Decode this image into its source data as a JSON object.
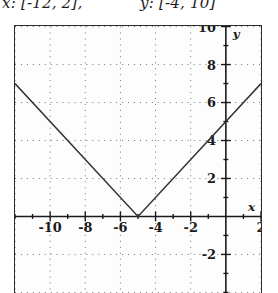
{
  "caption": {
    "x_part": "x: [-12, 2],",
    "y_part": "y: [-4, 10]"
  },
  "axis_labels": {
    "x": "x",
    "y": "y"
  },
  "chart_data": {
    "type": "line",
    "title": "",
    "xlabel": "x",
    "ylabel": "y",
    "xlim": [
      -12,
      2
    ],
    "ylim": [
      -4,
      10
    ],
    "grid": true,
    "grid_style": "dotted",
    "grid_spacing": {
      "x": 2,
      "y": 2
    },
    "tick_spacing": {
      "x": 1,
      "y": 1
    },
    "legend": "none",
    "xticks": [
      -10,
      -8,
      -6,
      -4,
      -2,
      2
    ],
    "xtick_labels": [
      "-10",
      "-8",
      "-6",
      "-4",
      "-2",
      "2"
    ],
    "yticks": [
      10,
      8,
      6,
      4,
      2,
      -2
    ],
    "ytick_labels": [
      "10",
      "8",
      "6",
      "4",
      "2",
      "-2"
    ],
    "series": [
      {
        "name": "y = |x + 5|",
        "vertex": [
          -5,
          0
        ],
        "points": [
          [
            -12,
            7
          ],
          [
            -5,
            0
          ],
          [
            2,
            7
          ]
        ]
      }
    ]
  }
}
